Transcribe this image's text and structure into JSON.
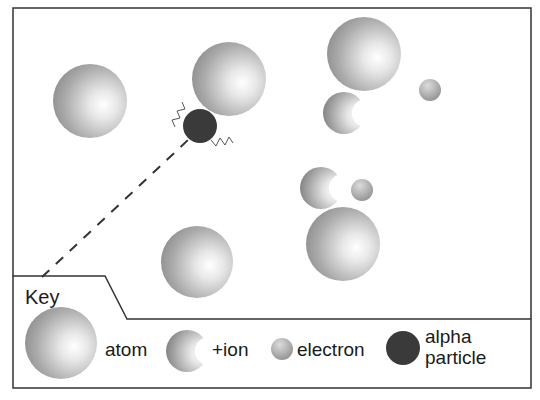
{
  "diagram": {
    "particles": [
      {
        "type": "atom",
        "cx": 90,
        "cy": 101,
        "r": 37
      },
      {
        "type": "atom",
        "cx": 229,
        "cy": 79,
        "r": 37
      },
      {
        "type": "atom",
        "cx": 364,
        "cy": 54,
        "r": 37
      },
      {
        "type": "atom",
        "cx": 197,
        "cy": 262,
        "r": 36
      },
      {
        "type": "atom",
        "cx": 343,
        "cy": 244,
        "r": 37
      },
      {
        "type": "ion",
        "cx": 344,
        "cy": 113,
        "r": 21
      },
      {
        "type": "ion",
        "cx": 321,
        "cy": 188,
        "r": 21
      },
      {
        "type": "electron",
        "cx": 430,
        "cy": 90,
        "r": 11
      },
      {
        "type": "electron",
        "cx": 362,
        "cy": 190,
        "r": 11
      },
      {
        "type": "alpha",
        "cx": 200,
        "cy": 126,
        "r": 17
      }
    ],
    "path": {
      "style": "dashed",
      "from": [
        42,
        277
      ],
      "to": [
        188,
        140
      ]
    }
  },
  "key": {
    "title": "Key",
    "items": [
      {
        "symbol": "atom",
        "label": "atom"
      },
      {
        "symbol": "ion",
        "label": "+ion"
      },
      {
        "symbol": "electron",
        "label": "electron"
      },
      {
        "symbol": "alpha",
        "label_line1": "alpha",
        "label_line2": "particle"
      }
    ]
  },
  "colors": {
    "border": "#333333",
    "atom_light": "#ffffff",
    "atom_dark": "#8a8a8a",
    "alpha": "#3a3a3a"
  }
}
